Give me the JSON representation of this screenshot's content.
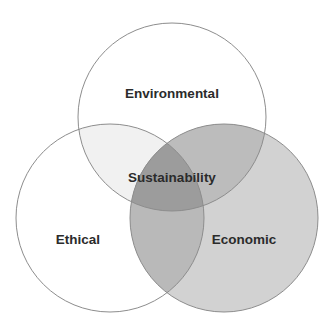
{
  "diagram": {
    "type": "venn",
    "canvas": {
      "width": 334,
      "height": 331,
      "background": "#ffffff"
    },
    "sets": [
      {
        "id": "environmental",
        "label": "Environmental",
        "label_x": 172,
        "label_y": 94,
        "cx": 172,
        "cy": 117,
        "r": 94,
        "fill": "#ffffff",
        "fill_opacity": 0,
        "stroke": "#8d8d8d"
      },
      {
        "id": "ethical",
        "label": "Ethical",
        "label_x": 78,
        "label_y": 240,
        "cx": 110,
        "cy": 218,
        "r": 94,
        "fill": "#ffffff",
        "fill_opacity": 0,
        "stroke": "#8d8d8d"
      },
      {
        "id": "economic",
        "label": "Economic",
        "label_x": 244,
        "label_y": 240,
        "cx": 224,
        "cy": 218,
        "r": 94,
        "fill": "#d2d2d2",
        "fill_opacity": 1,
        "stroke": "#8d8d8d"
      }
    ],
    "intersections": [
      {
        "id": "ethical-environmental",
        "label": "",
        "members": "Ethical + Environmental",
        "fill": "#f1f1f1"
      },
      {
        "id": "economic-environmental",
        "label": "",
        "members": "Economic + Environmental",
        "fill": "#bcbcbc"
      },
      {
        "id": "ethical-economic",
        "label": "",
        "members": "Ethical + Economic",
        "fill": "#b9b9b9"
      },
      {
        "id": "all-three",
        "label": "Sustainability",
        "label_x": 172,
        "label_y": 178,
        "members": "Environmental + Ethical + Economic",
        "fill": "#9c9c9c"
      }
    ],
    "colors": {
      "label_text": "#2b2b2b",
      "outline": "#8d8d8d",
      "background": "#ffffff"
    }
  }
}
